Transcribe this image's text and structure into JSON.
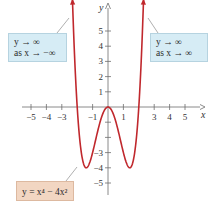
{
  "chart_data": {
    "type": "line",
    "title": "",
    "xlabel": "x",
    "ylabel": "y",
    "xlim": [
      -6,
      6
    ],
    "ylim": [
      -6,
      6.5
    ],
    "x_ticks": [
      -5,
      -4,
      -3,
      -1,
      1,
      3,
      4,
      5
    ],
    "x_tick_labels": [
      "−5",
      "−4",
      "−3",
      "−1",
      "1",
      "3",
      "4",
      "5"
    ],
    "y_ticks": [
      5,
      4,
      3,
      2,
      1,
      -1,
      -2,
      -3,
      -4,
      -5
    ],
    "y_tick_labels": [
      "5",
      "4",
      "3",
      "2",
      "1",
      "",
      "",
      "−3",
      "−4",
      "−5"
    ],
    "grid": false,
    "series": [
      {
        "name": "y = x^4 - 4x^2",
        "function": "x^4 - 4x^2",
        "color": "#c0282d",
        "x_range": [
          -2.31,
          2.31
        ],
        "key_points": [
          {
            "x": -2,
            "y": 0
          },
          {
            "x": -1.414,
            "y": -4
          },
          {
            "x": 0,
            "y": 0
          },
          {
            "x": 1.414,
            "y": -4
          },
          {
            "x": 2,
            "y": 0
          }
        ]
      }
    ],
    "annotations": [
      {
        "id": "left",
        "line1": "y → ∞",
        "line2": "as x → −∞",
        "color": "#d6ecf5"
      },
      {
        "id": "right",
        "line1": "y → ∞",
        "line2": "as x → ∞",
        "color": "#d6ecf5"
      },
      {
        "id": "equation",
        "text": "y = x⁴ − 4x²",
        "color": "#f2d6c2"
      }
    ]
  }
}
